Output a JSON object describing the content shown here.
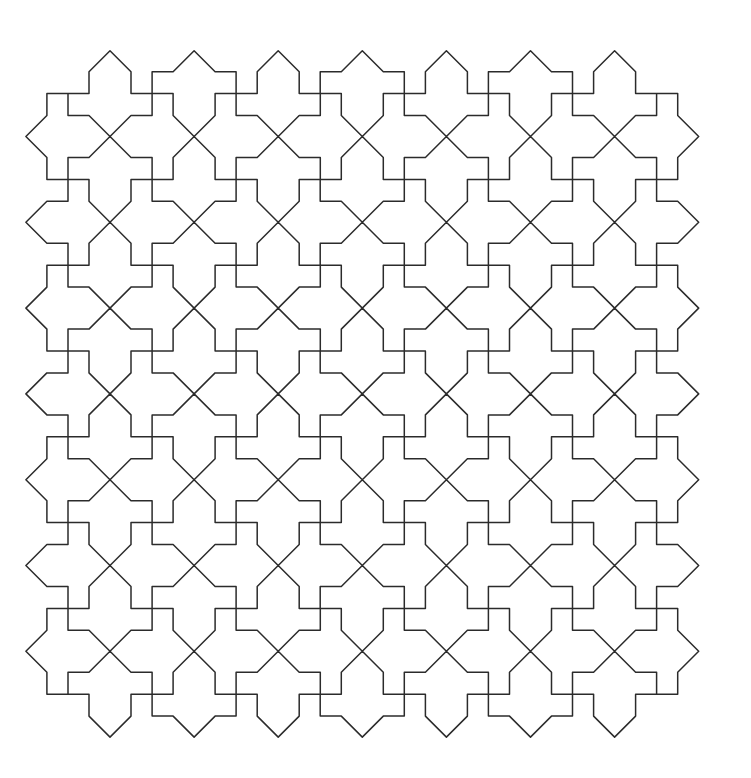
{
  "figure": {
    "background": "#ffffff",
    "stroke_color": "#2b2b2b",
    "stroke_width": 1.5
  },
  "lattice": {
    "origin_x": 110,
    "origin_y": 136.5,
    "step_x": 84.1,
    "step_y": 85.8,
    "cols": 7,
    "rows": 7,
    "diagonal_offset": 21,
    "crossing_rule": "checkerboard: (col+row) even = horizontal arms, odd = vertical arms",
    "border": "virtual crossings one step outside the grid draw only their inward half"
  }
}
